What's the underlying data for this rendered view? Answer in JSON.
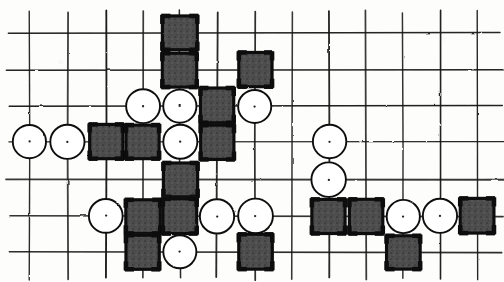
{
  "board": {
    "title": "Hand-drawn Go / Gomoku board diagram",
    "type": "go-board-diagram",
    "width": 504,
    "height": 282,
    "grid": {
      "columns": 13,
      "rows": 7,
      "column_x": [
        30,
        68,
        106,
        143,
        180,
        217,
        255,
        292,
        329,
        366,
        403,
        440,
        477
      ],
      "row_y": [
        33,
        70,
        106,
        142,
        180,
        216,
        252
      ],
      "line_color": "#1a1a1a",
      "line_width": 1.6,
      "style": "hand-drawn"
    },
    "colors": {
      "black_stone_fill": "#4a4a4a",
      "black_stone_border": "#111111",
      "white_stone_fill": "#ffffff",
      "white_stone_border": "#111111",
      "background": "#fdfdfb",
      "grid_line": "#1a1a1a"
    },
    "legend": {
      "black_label": "black stone (dark square)",
      "white_label": "white stone (open circle)"
    },
    "stones": [
      {
        "id": "s1",
        "color": "black",
        "col": 5,
        "row": 1
      },
      {
        "id": "s2",
        "color": "black",
        "col": 5,
        "row": 2
      },
      {
        "id": "s3",
        "color": "black",
        "col": 7,
        "row": 2
      },
      {
        "id": "s4",
        "color": "white",
        "col": 4,
        "row": 3
      },
      {
        "id": "s5",
        "color": "white",
        "col": 5,
        "row": 3
      },
      {
        "id": "s6",
        "color": "black",
        "col": 6,
        "row": 3
      },
      {
        "id": "s7",
        "color": "white",
        "col": 7,
        "row": 3
      },
      {
        "id": "s8",
        "color": "white",
        "col": 1,
        "row": 4
      },
      {
        "id": "s9",
        "color": "white",
        "col": 2,
        "row": 4
      },
      {
        "id": "s10",
        "color": "black",
        "col": 3,
        "row": 4
      },
      {
        "id": "s11",
        "color": "black",
        "col": 4,
        "row": 4
      },
      {
        "id": "s12",
        "color": "white",
        "col": 5,
        "row": 4
      },
      {
        "id": "s13",
        "color": "black",
        "col": 6,
        "row": 4
      },
      {
        "id": "s14",
        "color": "white",
        "col": 9,
        "row": 4
      },
      {
        "id": "s15",
        "color": "black",
        "col": 5,
        "row": 5
      },
      {
        "id": "s16",
        "color": "white",
        "col": 9,
        "row": 5
      },
      {
        "id": "s17",
        "color": "white",
        "col": 3,
        "row": 6
      },
      {
        "id": "s18",
        "color": "black",
        "col": 4,
        "row": 6
      },
      {
        "id": "s19",
        "color": "black",
        "col": 5,
        "row": 6
      },
      {
        "id": "s20",
        "color": "white",
        "col": 6,
        "row": 6
      },
      {
        "id": "s21",
        "color": "white",
        "col": 7,
        "row": 6
      },
      {
        "id": "s22",
        "color": "black",
        "col": 9,
        "row": 6
      },
      {
        "id": "s23",
        "color": "black",
        "col": 10,
        "row": 6
      },
      {
        "id": "s24",
        "color": "white",
        "col": 11,
        "row": 6
      },
      {
        "id": "s25",
        "color": "white",
        "col": 12,
        "row": 6
      },
      {
        "id": "s26",
        "color": "black",
        "col": 13,
        "row": 6
      },
      {
        "id": "s27",
        "color": "black",
        "col": 4,
        "row": 7
      },
      {
        "id": "s28",
        "color": "white",
        "col": 5,
        "row": 7
      },
      {
        "id": "s29",
        "color": "black",
        "col": 7,
        "row": 7
      },
      {
        "id": "s30",
        "color": "black",
        "col": 11,
        "row": 7
      }
    ]
  }
}
